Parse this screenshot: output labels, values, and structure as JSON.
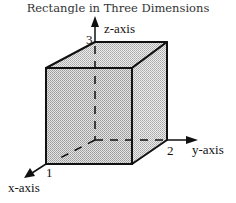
{
  "title": "Rectangle in Three Dimensions",
  "axes": {
    "x": {
      "label": "x-axis",
      "tick": "1"
    },
    "y": {
      "label": "y-axis",
      "tick": "2"
    },
    "z": {
      "label": "z-axis",
      "tick": "3"
    }
  },
  "colors": {
    "stroke": "#111111",
    "face_fill": "#c8c8c8",
    "side_fill": "#d6d6d6",
    "top_fill": "#dedede"
  }
}
